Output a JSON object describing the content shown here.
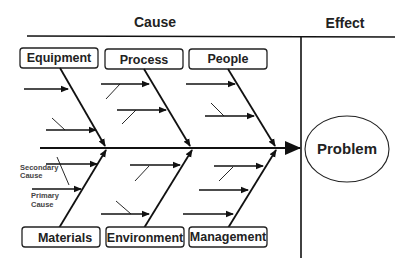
{
  "header": {
    "cause_label": "Cause",
    "effect_label": "Effect"
  },
  "categories": {
    "top": [
      {
        "label": "Equipment"
      },
      {
        "label": "Process"
      },
      {
        "label": "People"
      }
    ],
    "bottom": [
      {
        "label": "Materials"
      },
      {
        "label": "Environment"
      },
      {
        "label": "Management"
      }
    ]
  },
  "annotations": {
    "secondary_cause": [
      "Secondary",
      "Cause"
    ],
    "primary_cause": [
      "Primary",
      "Cause"
    ]
  },
  "effect": {
    "label": "Problem"
  },
  "colors": {
    "line": "#111111",
    "text": "#222222",
    "annotation_text": "#444444",
    "background": "#ffffff"
  }
}
